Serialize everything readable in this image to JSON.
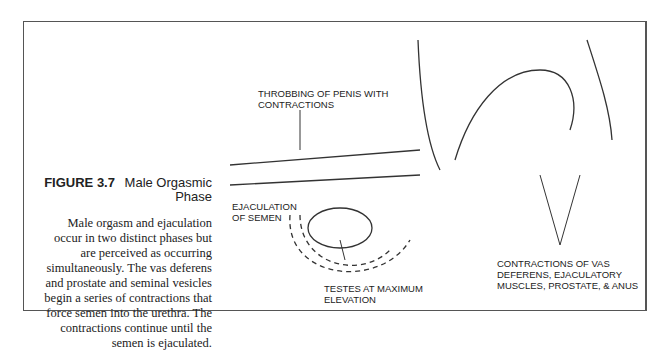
{
  "figure": {
    "number": "FIGURE 3.7",
    "title": "Male Orgasmic Phase",
    "caption": "Male orgasm and ejaculation occur in two distinct phases but are perceived as occurring simultaneously. The vas deferens and prostate and seminal vesicles begin a series of contractions that force semen into the urethra. The contractions continue until the semen is ejaculated."
  },
  "labels": {
    "throbbing": "Throbbing of penis with contractions",
    "ejaculation": "Ejaculation of semen",
    "testes": "Testes at maximum elevation",
    "contractions": "Contractions of vas deferens, ejaculatory muscles, prostate, & anus"
  }
}
